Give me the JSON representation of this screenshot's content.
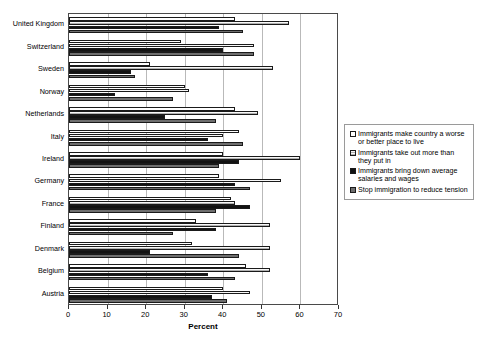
{
  "chart_data": {
    "type": "bar",
    "orientation": "horizontal",
    "title": "",
    "xlabel": "Percent",
    "ylabel": "",
    "xlim": [
      0,
      70
    ],
    "xticks": [
      0,
      10,
      20,
      30,
      40,
      50,
      60,
      70
    ],
    "xticklabels": [
      "0",
      "10",
      "20",
      "30",
      "40",
      "50",
      "60",
      "70"
    ],
    "grid": "vertical",
    "legend_position": "right",
    "categories": [
      "United Kingdom",
      "Switzerland",
      "Sweden",
      "Norway",
      "Netherlands",
      "Italy",
      "Ireland",
      "Germany",
      "France",
      "Finland",
      "Denmark",
      "Belgium",
      "Austria"
    ],
    "series": [
      {
        "name": "Immigrants make country a worse or better place to live",
        "color": "#ffffff",
        "values": [
          43,
          29,
          21,
          30,
          43,
          44,
          40,
          39,
          42,
          33,
          32,
          46,
          40
        ]
      },
      {
        "name": "Immigrants take out more than they put in",
        "color": "#d2d2d2",
        "values": [
          57,
          48,
          53,
          31,
          49,
          40,
          60,
          55,
          43,
          52,
          52,
          52,
          47
        ]
      },
      {
        "name": "Immigrants bring down average salaries and wages",
        "color": "#121212",
        "values": [
          39,
          40,
          16,
          12,
          25,
          36,
          44,
          43,
          47,
          38,
          21,
          36,
          37
        ]
      },
      {
        "name": "Stop immigration to reduce tension",
        "color": "#6e6e6e",
        "values": [
          45,
          48,
          17,
          27,
          38,
          45,
          39,
          47,
          38,
          27,
          44,
          43,
          41
        ]
      }
    ]
  },
  "legend": {
    "items": [
      {
        "label": "Immigrants make country a worse or better place to live"
      },
      {
        "label": "Immigrants take out more than they put in"
      },
      {
        "label": "Immigrants bring down average salaries and wages"
      },
      {
        "label": "Stop immigration to reduce tension"
      }
    ]
  }
}
